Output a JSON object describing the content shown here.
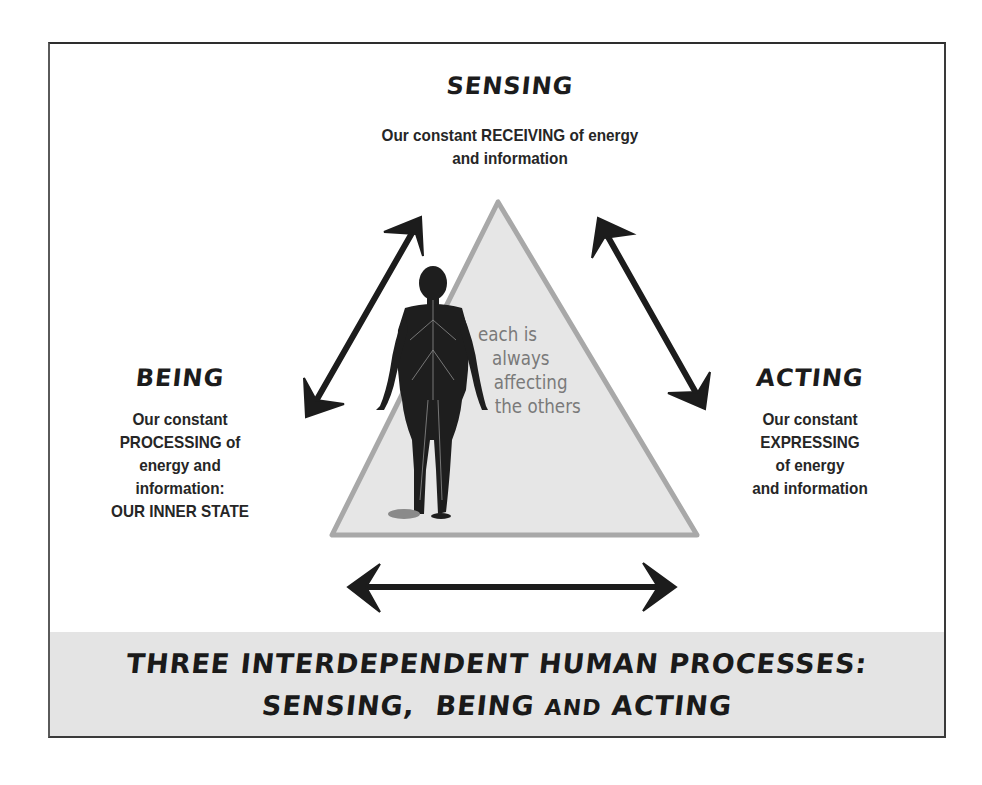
{
  "diagram": {
    "title_line1": "THREE INTERDEPENDENT HUMAN PROCESSES:",
    "title_line2_parts": {
      "a": "SENSING,",
      "b": "BEING",
      "c": "AND",
      "d": "ACTING"
    },
    "center_text": [
      "each is",
      "always",
      "affecting",
      "the others"
    ],
    "center_figure": "human-nervous-system-figure",
    "nodes": {
      "sensing": {
        "heading": "SENSING",
        "lines": [
          "Our constant RECEIVING of energy",
          "and information"
        ]
      },
      "being": {
        "heading": "BEING",
        "lines": [
          "Our constant",
          "PROCESSING of",
          "energy and",
          "information:",
          "OUR INNER STATE"
        ]
      },
      "acting": {
        "heading": "ACTING",
        "lines": [
          "Our constant",
          "EXPRESSING",
          "of energy",
          "and information"
        ]
      }
    },
    "arrows": [
      {
        "from": "being",
        "to": "sensing",
        "icon": "double-arrow-icon"
      },
      {
        "from": "sensing",
        "to": "acting",
        "icon": "double-arrow-icon"
      },
      {
        "from": "being",
        "to": "acting",
        "icon": "double-arrow-icon"
      }
    ],
    "colors": {
      "triangle_fill": "#e6e6e6",
      "triangle_edge": "#a8a8a8",
      "band_fill": "#e4e4e4",
      "ink": "#1c1c1c",
      "center_text": "#7a7a7a"
    }
  }
}
